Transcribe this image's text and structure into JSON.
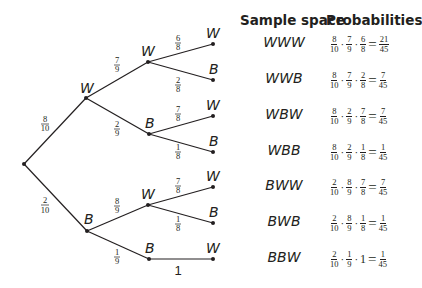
{
  "headers": {
    "sample_space": "Sample space",
    "probabilities": "Probabilities"
  },
  "tree": {
    "level1": [
      {
        "label": "W",
        "prob_num": "8",
        "prob_den": "10"
      },
      {
        "label": "B",
        "prob_num": "2",
        "prob_den": "10"
      }
    ],
    "level2": [
      {
        "label": "W",
        "prob_num": "7",
        "prob_den": "9"
      },
      {
        "label": "B",
        "prob_num": "2",
        "prob_den": "9"
      },
      {
        "label": "W",
        "prob_num": "8",
        "prob_den": "9"
      },
      {
        "label": "B",
        "prob_num": "1",
        "prob_den": "9"
      }
    ],
    "level3": [
      {
        "label": "W",
        "prob_num": "6",
        "prob_den": "8"
      },
      {
        "label": "B",
        "prob_num": "2",
        "prob_den": "8"
      },
      {
        "label": "W",
        "prob_num": "7",
        "prob_den": "8"
      },
      {
        "label": "B",
        "prob_num": "1",
        "prob_den": "8"
      },
      {
        "label": "W",
        "prob_num": "7",
        "prob_den": "8"
      },
      {
        "label": "B",
        "prob_num": "1",
        "prob_den": "8"
      },
      {
        "label": "W",
        "prob_whole": "1"
      }
    ]
  },
  "outcomes": [
    {
      "sample": "WWW",
      "factors": [
        [
          "8",
          "10"
        ],
        [
          "7",
          "9"
        ],
        [
          "6",
          "8"
        ]
      ],
      "result": [
        "21",
        "45"
      ]
    },
    {
      "sample": "WWB",
      "factors": [
        [
          "8",
          "10"
        ],
        [
          "7",
          "9"
        ],
        [
          "2",
          "8"
        ]
      ],
      "result": [
        "7",
        "45"
      ]
    },
    {
      "sample": "WBW",
      "factors": [
        [
          "8",
          "10"
        ],
        [
          "2",
          "9"
        ],
        [
          "7",
          "8"
        ]
      ],
      "result": [
        "7",
        "45"
      ]
    },
    {
      "sample": "WBB",
      "factors": [
        [
          "8",
          "10"
        ],
        [
          "2",
          "9"
        ],
        [
          "1",
          "8"
        ]
      ],
      "result": [
        "1",
        "45"
      ]
    },
    {
      "sample": "BWW",
      "factors": [
        [
          "2",
          "10"
        ],
        [
          "8",
          "9"
        ],
        [
          "7",
          "8"
        ]
      ],
      "result": [
        "7",
        "45"
      ]
    },
    {
      "sample": "BWB",
      "factors": [
        [
          "2",
          "10"
        ],
        [
          "8",
          "9"
        ],
        [
          "1",
          "8"
        ]
      ],
      "result": [
        "1",
        "45"
      ]
    },
    {
      "sample": "BBW",
      "factors": [
        [
          "2",
          "10"
        ],
        [
          "1",
          "9"
        ],
        [
          "1"
        ]
      ],
      "result": [
        "1",
        "45"
      ]
    }
  ]
}
